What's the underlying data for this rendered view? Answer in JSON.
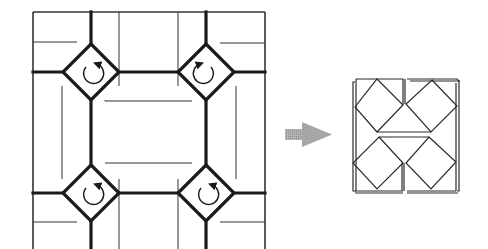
{
  "diagram": {
    "colors": {
      "line": "#1a1a1a",
      "thin_line": "#333333",
      "arrow_fill": "#a6a6a6",
      "background": "#ffffff"
    },
    "left_figure": {
      "label": "crease-pattern",
      "twists": [
        {
          "position": "top-left",
          "rotation": "clockwise",
          "cx": 91,
          "cy": 72
        },
        {
          "position": "top-right",
          "rotation": "counterclockwise",
          "cx": 206,
          "cy": 72
        },
        {
          "position": "bottom-left",
          "rotation": "counterclockwise",
          "cx": 91,
          "cy": 193
        },
        {
          "position": "bottom-right",
          "rotation": "clockwise",
          "cx": 206,
          "cy": 193
        }
      ]
    },
    "transition_arrow": {
      "direction": "right"
    },
    "right_figure": {
      "label": "folded-result",
      "squares": [
        "top-left",
        "top-right",
        "bottom-left",
        "bottom-right"
      ]
    }
  }
}
